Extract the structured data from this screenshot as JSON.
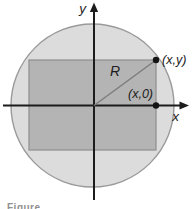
{
  "figure": {
    "caption_fragment": "Figure",
    "labels": {
      "y_axis": "y",
      "x_axis": "x",
      "radius": "R",
      "point_on_circle": "(x,y)",
      "point_on_axis": "(x,0)"
    },
    "colors": {
      "circle_fill": "#dcdcdc",
      "circle_stroke": "#9a9a9a",
      "rect_fill": "#b4b4b4",
      "rect_stroke": "#8e8e8e",
      "axis": "#1c1c1c",
      "radius_line": "#7d7d7d",
      "point": "#141414",
      "label_text": "#1c1c1c",
      "caption_text": "#8f8f8f"
    }
  }
}
